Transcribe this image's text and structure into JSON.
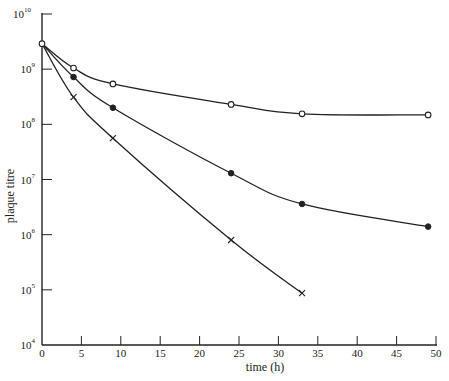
{
  "chart_data": {
    "type": "line",
    "title": "",
    "xlabel": "time (h)",
    "ylabel": "plaque titre",
    "xlim": [
      0,
      50
    ],
    "ylim": [
      10000,
      10000000000
    ],
    "yscale": "log",
    "grid": false,
    "legend": null,
    "x_ticks": [
      0,
      5,
      10,
      15,
      20,
      25,
      30,
      35,
      40,
      45,
      50
    ],
    "y_ticks": [
      {
        "exp": "4",
        "value": 10000
      },
      {
        "exp": "5",
        "value": 100000
      },
      {
        "exp": "6",
        "value": 1000000
      },
      {
        "exp": "7",
        "value": 10000000
      },
      {
        "exp": "8",
        "value": 100000000
      },
      {
        "exp": "9",
        "value": 1000000000
      },
      {
        "exp": "10",
        "value": 10000000000
      }
    ],
    "series": [
      {
        "name": "open circles",
        "marker": "open-circle",
        "x": [
          0,
          4,
          9,
          24,
          33,
          49
        ],
        "values": [
          2900000000,
          1050000000,
          540000000,
          230000000,
          155000000,
          148000000
        ]
      },
      {
        "name": "filled circles",
        "marker": "filled-circle",
        "x": [
          0,
          4,
          9,
          24,
          33,
          49
        ],
        "values": [
          2900000000,
          720000000,
          200000000,
          13000000,
          3600000,
          1400000
        ]
      },
      {
        "name": "crosses",
        "marker": "cross",
        "x": [
          0,
          4,
          9,
          24,
          33
        ],
        "values": [
          2900000000,
          310000000,
          56000000,
          800000,
          87000
        ]
      }
    ]
  },
  "colors": {
    "ink": "#222222",
    "background": "#ffffff"
  }
}
